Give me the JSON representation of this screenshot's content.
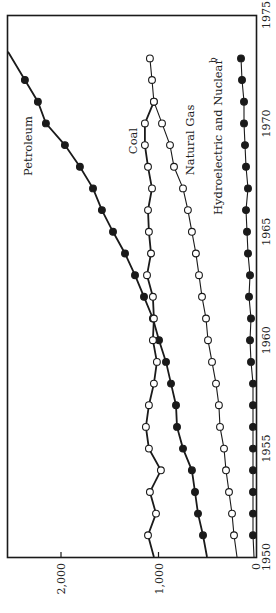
{
  "chart_data": {
    "type": "line",
    "orientation": "rotated-90-clockwise",
    "title": "",
    "xlabel": "Year",
    "ylabel": "",
    "x": [
      1950,
      1951,
      1952,
      1953,
      1954,
      1955,
      1956,
      1957,
      1958,
      1959,
      1960,
      1961,
      1962,
      1963,
      1964,
      1965,
      1966,
      1967,
      1968,
      1969,
      1970,
      1971,
      1972,
      1973
    ],
    "xlim": [
      1950,
      1975
    ],
    "ylim": [
      0,
      2550
    ],
    "x_ticks": [
      "1950",
      "1955",
      "1960",
      "1965",
      "1970",
      "1975"
    ],
    "y_ticks": [
      "0",
      "1,000",
      "2,000"
    ],
    "y_tick_values": [
      0,
      1000,
      2000
    ],
    "grid": false,
    "legend": "inline labels",
    "series": [
      {
        "name": "Petroleum",
        "marker": "filled-circle",
        "line_weight": "heavy",
        "start_value": 503,
        "values": [
          null,
          544,
          595,
          626,
          657,
          749,
          810,
          821,
          872,
          923,
          995,
          1057,
          1149,
          1241,
          1344,
          1467,
          1580,
          1672,
          1806,
          1960,
          2155,
          2237,
          2370,
          null
        ],
        "extends_beyond_plot_after": 1972
      },
      {
        "name": "Coal",
        "marker": "open-circle",
        "line_weight": "heavy",
        "start_value": 1047,
        "values": [
          null,
          1108,
          1026,
          1088,
          975,
          1098,
          1129,
          1098,
          1047,
          1016,
          1057,
          1047,
          1057,
          1118,
          1077,
          1098,
          1108,
          1067,
          1108,
          1139,
          1139,
          1047,
          null,
          null
        ]
      },
      {
        "name": "Natural Gas",
        "marker": "open-circle",
        "line_weight": "light",
        "start_value": 195,
        "values": [
          null,
          226,
          246,
          277,
          308,
          328,
          369,
          380,
          410,
          451,
          492,
          513,
          554,
          585,
          616,
          657,
          698,
          749,
          841,
          882,
          964,
          1047,
          1067,
          1088
        ]
      },
      {
        "name": "Hydroelectric and Nuclear",
        "superscript": "b",
        "marker": "filled-circle",
        "line_weight": "light",
        "start_value": 21,
        "values": [
          null,
          31,
          31,
          31,
          31,
          31,
          31,
          31,
          31,
          51,
          62,
          51,
          72,
          62,
          82,
          92,
          103,
          82,
          103,
          113,
          123,
          123,
          144,
          154
        ]
      }
    ]
  },
  "labels": {
    "petroleum": "Petroleum",
    "coal": "Coal",
    "natural_gas": "Natural Gas",
    "hydro": "Hydroelectric and Nuclear",
    "hydro_sup": "b"
  }
}
